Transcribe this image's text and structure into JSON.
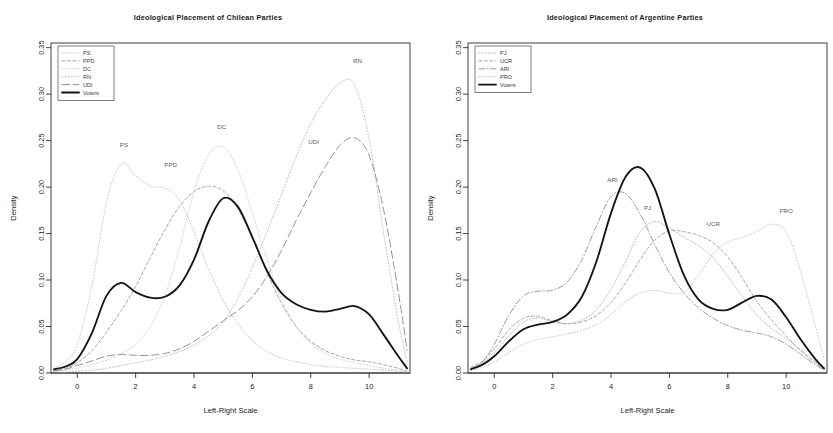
{
  "figure": {
    "width": 833,
    "height": 433,
    "background": "#ffffff",
    "panel_count": 2
  },
  "axes": {
    "xlabel": "Left-Right Scale",
    "ylabel": "Density",
    "xticks": [
      "0",
      "2",
      "4",
      "6",
      "8",
      "10"
    ],
    "xtick_values": [
      0,
      2,
      4,
      6,
      8,
      10
    ],
    "yticks": [
      "0.00",
      "0.05",
      "0.10",
      "0.15",
      "0.20",
      "0.25",
      "0.30",
      "0.35"
    ],
    "ytick_values": [
      0.0,
      0.05,
      0.1,
      0.15,
      0.2,
      0.25,
      0.3,
      0.35
    ],
    "xlim": [
      -0.9,
      11.4
    ],
    "ylim": [
      0.0,
      0.355
    ],
    "grid": false
  },
  "chart_data": [
    {
      "type": "line",
      "panel": "left",
      "title": "Ideological Placement of Chilean Parties",
      "xlabel": "Left-Right Scale",
      "ylabel": "Density",
      "xlim": [
        -0.9,
        11.4
      ],
      "ylim": [
        0.0,
        0.355
      ],
      "grid": false,
      "legend_position": "top-left",
      "x": [
        -0.8,
        -0.4,
        0,
        0.5,
        1,
        1.5,
        2,
        2.5,
        3,
        3.5,
        4,
        4.5,
        5,
        5.5,
        6,
        6.5,
        7,
        7.5,
        8,
        8.5,
        9,
        9.5,
        10,
        10.5,
        11,
        11.3
      ],
      "series": [
        {
          "name": "PS",
          "style": "dotted",
          "color": "#b9b9b9",
          "label_x": 1.6,
          "label_y": 0.243,
          "values": [
            0.006,
            0.012,
            0.031,
            0.093,
            0.183,
            0.225,
            0.212,
            0.201,
            0.199,
            0.186,
            0.152,
            0.112,
            0.078,
            0.053,
            0.035,
            0.023,
            0.016,
            0.012,
            0.009,
            0.007,
            0.006,
            0.005,
            0.004,
            0.003,
            0.002,
            0.001
          ]
        },
        {
          "name": "PPD",
          "style": "dashed",
          "color": "#9a9a9a",
          "label_x": 3.2,
          "label_y": 0.222,
          "values": [
            0.003,
            0.005,
            0.011,
            0.024,
            0.044,
            0.067,
            0.093,
            0.124,
            0.154,
            0.179,
            0.195,
            0.201,
            0.196,
            0.177,
            0.145,
            0.108,
            0.075,
            0.05,
            0.034,
            0.024,
            0.018,
            0.014,
            0.012,
            0.009,
            0.005,
            0.002
          ]
        },
        {
          "name": "DC",
          "style": "dotted",
          "color": "#c4c4c4",
          "label_x": 4.95,
          "label_y": 0.262,
          "values": [
            0.002,
            0.003,
            0.005,
            0.009,
            0.014,
            0.021,
            0.031,
            0.05,
            0.083,
            0.135,
            0.195,
            0.235,
            0.243,
            0.219,
            0.172,
            0.122,
            0.079,
            0.05,
            0.032,
            0.021,
            0.015,
            0.011,
            0.008,
            0.005,
            0.003,
            0.001
          ]
        },
        {
          "name": "RN",
          "style": "dotted",
          "color": "#b0b0b0",
          "label_x": 9.6,
          "label_y": 0.333,
          "values": [
            0.001,
            0.001,
            0.002,
            0.003,
            0.005,
            0.008,
            0.011,
            0.014,
            0.018,
            0.023,
            0.03,
            0.04,
            0.055,
            0.08,
            0.113,
            0.152,
            0.192,
            0.233,
            0.268,
            0.294,
            0.312,
            0.31,
            0.252,
            0.15,
            0.055,
            0.012
          ]
        },
        {
          "name": "UDI",
          "style": "longdash",
          "color": "#8c8c8c",
          "label_x": 8.1,
          "label_y": 0.246,
          "values": [
            0.002,
            0.004,
            0.008,
            0.013,
            0.018,
            0.02,
            0.019,
            0.019,
            0.021,
            0.026,
            0.034,
            0.045,
            0.056,
            0.067,
            0.082,
            0.104,
            0.132,
            0.164,
            0.194,
            0.222,
            0.245,
            0.253,
            0.234,
            0.175,
            0.087,
            0.024
          ]
        },
        {
          "name": "Voters",
          "style": "solid",
          "color": "#141414",
          "emphasis": true,
          "values": [
            0.004,
            0.007,
            0.015,
            0.043,
            0.083,
            0.097,
            0.087,
            0.081,
            0.082,
            0.094,
            0.122,
            0.163,
            0.188,
            0.179,
            0.146,
            0.11,
            0.086,
            0.074,
            0.068,
            0.066,
            0.069,
            0.072,
            0.063,
            0.041,
            0.018,
            0.005
          ]
        }
      ],
      "legend": [
        {
          "label": "PS",
          "style": "dotted"
        },
        {
          "label": "PPD",
          "style": "dashed"
        },
        {
          "label": "DC",
          "style": "dotted"
        },
        {
          "label": "RN",
          "style": "dotted"
        },
        {
          "label": "UDI",
          "style": "longdash"
        },
        {
          "label": "Voters",
          "style": "solid"
        }
      ]
    },
    {
      "type": "line",
      "panel": "right",
      "title": "Ideological Placement of Argentine Parties",
      "xlabel": "Left-Right Scale",
      "ylabel": "Density",
      "xlim": [
        -0.9,
        11.4
      ],
      "ylim": [
        0.0,
        0.355
      ],
      "grid": false,
      "legend_position": "top-left",
      "x": [
        -0.8,
        -0.4,
        0,
        0.5,
        1,
        1.5,
        2,
        2.5,
        3,
        3.5,
        4,
        4.5,
        5,
        5.5,
        6,
        6.5,
        7,
        7.5,
        8,
        8.5,
        9,
        9.5,
        10,
        10.5,
        11,
        11.3
      ],
      "series": [
        {
          "name": "PJ",
          "style": "dotted",
          "color": "#a8a8a8",
          "label_x": 5.25,
          "label_y": 0.175,
          "values": [
            0.005,
            0.011,
            0.022,
            0.04,
            0.055,
            0.059,
            0.055,
            0.053,
            0.057,
            0.068,
            0.09,
            0.12,
            0.152,
            0.163,
            0.156,
            0.146,
            0.137,
            0.124,
            0.104,
            0.082,
            0.062,
            0.048,
            0.037,
            0.025,
            0.012,
            0.004
          ]
        },
        {
          "name": "UCR",
          "style": "dashed",
          "color": "#9e9e9e",
          "label_x": 7.5,
          "label_y": 0.158,
          "values": [
            0.006,
            0.013,
            0.026,
            0.046,
            0.059,
            0.061,
            0.056,
            0.053,
            0.055,
            0.062,
            0.076,
            0.097,
            0.122,
            0.143,
            0.153,
            0.152,
            0.148,
            0.14,
            0.125,
            0.102,
            0.077,
            0.057,
            0.04,
            0.024,
            0.011,
            0.004
          ]
        },
        {
          "name": "ARI",
          "style": "dashdot",
          "color": "#8e8e8e",
          "label_x": 4.05,
          "label_y": 0.205,
          "values": [
            0.004,
            0.012,
            0.031,
            0.062,
            0.083,
            0.088,
            0.089,
            0.098,
            0.122,
            0.158,
            0.19,
            0.193,
            0.171,
            0.138,
            0.108,
            0.086,
            0.07,
            0.059,
            0.051,
            0.046,
            0.043,
            0.039,
            0.031,
            0.02,
            0.009,
            0.003
          ]
        },
        {
          "name": "PRO",
          "style": "dotted",
          "color": "#bcbcbc",
          "label_x": 10.0,
          "label_y": 0.172,
          "values": [
            0.003,
            0.006,
            0.012,
            0.022,
            0.031,
            0.036,
            0.039,
            0.042,
            0.046,
            0.052,
            0.063,
            0.077,
            0.086,
            0.089,
            0.086,
            0.087,
            0.105,
            0.128,
            0.141,
            0.146,
            0.152,
            0.16,
            0.152,
            0.109,
            0.05,
            0.016
          ]
        },
        {
          "name": "Voters",
          "style": "solid",
          "color": "#141414",
          "emphasis": true,
          "values": [
            0.004,
            0.009,
            0.018,
            0.034,
            0.047,
            0.052,
            0.055,
            0.063,
            0.082,
            0.12,
            0.172,
            0.211,
            0.221,
            0.198,
            0.149,
            0.105,
            0.079,
            0.069,
            0.068,
            0.076,
            0.083,
            0.079,
            0.06,
            0.036,
            0.015,
            0.005
          ]
        }
      ],
      "legend": [
        {
          "label": "PJ",
          "style": "dotted"
        },
        {
          "label": "UCR",
          "style": "dashed"
        },
        {
          "label": "ARI",
          "style": "dashdot"
        },
        {
          "label": "PRO",
          "style": "dotted"
        },
        {
          "label": "Voters",
          "style": "solid"
        }
      ]
    }
  ]
}
